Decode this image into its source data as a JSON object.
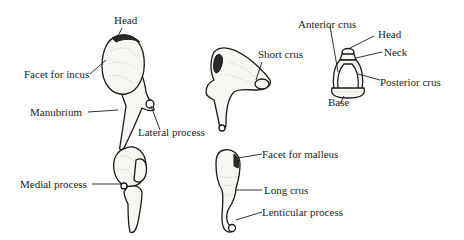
{
  "diagram": {
    "colors": {
      "background": "#ffffff",
      "ink": "#1a1a1a",
      "bone_fill": "#f6f6f2"
    },
    "figures": [
      {
        "id": "malleus-lateral",
        "labels": {
          "head": "Head",
          "facet_for_incus": "Facet for incus",
          "manubrium": "Manubrium",
          "lateral_process": "Lateral process"
        }
      },
      {
        "id": "incus-lateral",
        "labels": {
          "short_crus": "Short crus"
        }
      },
      {
        "id": "stapes",
        "labels": {
          "anterior_crus": "Anterior crus",
          "head": "Head",
          "neck": "Neck",
          "posterior_crus": "Posterior crus",
          "base": "Base"
        }
      },
      {
        "id": "malleus-medial",
        "labels": {
          "medial_process": "Medial process"
        }
      },
      {
        "id": "incus-medial",
        "labels": {
          "facet_for_malleus": "Facet for malleus",
          "long_crus": "Long crus",
          "lenticular_process": "Lenticular process"
        }
      }
    ]
  }
}
